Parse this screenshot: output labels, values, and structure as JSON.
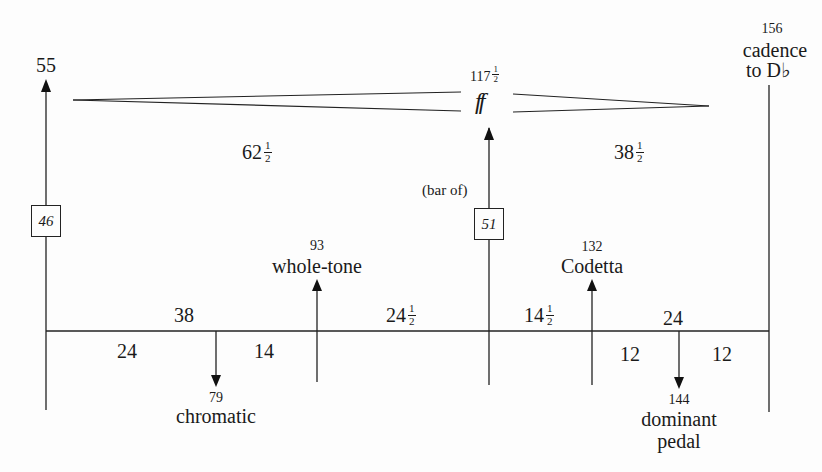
{
  "diagram": {
    "type": "musical-form-proportion-diagram",
    "key_points": {
      "start": {
        "bar": "55"
      },
      "climax": {
        "bar": "117",
        "bar_fraction": "1/2",
        "dynamic": "ff"
      },
      "end": {
        "bar": "156",
        "label_line1": "cadence",
        "label_line2": "to D♭"
      }
    },
    "hairpin_spans": {
      "crescendo": {
        "whole": "62",
        "fraction": "1/2"
      },
      "diminuendo": {
        "whole": "38",
        "fraction": "1/2"
      }
    },
    "boxed_lengths": {
      "first": {
        "value": "46"
      },
      "second": {
        "value": "51",
        "prefix": "(bar of)"
      }
    },
    "upper_events": [
      {
        "bar": "93",
        "label": "whole-tone"
      },
      {
        "bar": "132",
        "label": "Codetta"
      }
    ],
    "lower_events": [
      {
        "bar": "79",
        "label": "chromatic"
      },
      {
        "bar": "144",
        "label_line1": "dominant",
        "label_line2": "pedal"
      }
    ],
    "timeline_above": [
      {
        "whole": "38",
        "fraction": ""
      },
      {
        "whole": "24",
        "fraction": "1/2"
      },
      {
        "whole": "14",
        "fraction": "1/2"
      },
      {
        "whole": "24",
        "fraction": ""
      }
    ],
    "timeline_below": [
      {
        "value": "24"
      },
      {
        "value": "14"
      },
      {
        "value": "12"
      },
      {
        "value": "12"
      }
    ],
    "fraction_parts": {
      "numerator": "1",
      "denominator": "2"
    }
  }
}
